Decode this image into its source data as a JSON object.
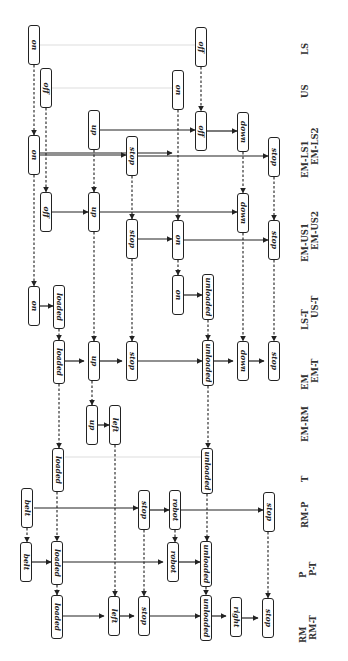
{
  "diagram": {
    "orientation": "rotated 90 degrees",
    "row_labels": [
      {
        "id": "LS",
        "text": "LS",
        "x": 300,
        "y": 55
      },
      {
        "id": "US",
        "text": "US",
        "x": 300,
        "y": 98
      },
      {
        "id": "EM-LS1",
        "text": "EM-LS1",
        "x": 300,
        "y": 178
      },
      {
        "id": "EM-LS2",
        "text": "EM-LS2",
        "x": 310,
        "y": 165
      },
      {
        "id": "EM-US1",
        "text": "EM-US1",
        "x": 300,
        "y": 262
      },
      {
        "id": "EM-US2",
        "text": "EM-US2",
        "x": 310,
        "y": 250
      },
      {
        "id": "LS-T",
        "text": "LS-T",
        "x": 300,
        "y": 330
      },
      {
        "id": "US-T",
        "text": "US-T",
        "x": 310,
        "y": 318
      },
      {
        "id": "EM",
        "text": "EM",
        "x": 300,
        "y": 390
      },
      {
        "id": "EM-T",
        "text": "EM-T",
        "x": 310,
        "y": 383
      },
      {
        "id": "EM-RM",
        "text": "EM-RM",
        "x": 300,
        "y": 442
      },
      {
        "id": "T",
        "text": "T",
        "x": 300,
        "y": 482
      },
      {
        "id": "RM-P",
        "text": "RM-P",
        "x": 300,
        "y": 528
      },
      {
        "id": "P",
        "text": "P",
        "x": 298,
        "y": 578
      },
      {
        "id": "P-T",
        "text": "P-T",
        "x": 308,
        "y": 576
      },
      {
        "id": "RM",
        "text": "RM",
        "x": 298,
        "y": 643
      },
      {
        "id": "RM-T",
        "text": "RM-T",
        "x": 308,
        "y": 640
      }
    ],
    "nodes": [
      {
        "id": "n1",
        "label": "on",
        "x": 28,
        "y": 25,
        "h": 40
      },
      {
        "id": "n2",
        "label": "off",
        "x": 40,
        "y": 68,
        "h": 40
      },
      {
        "id": "n3",
        "label": "on",
        "x": 172,
        "y": 70,
        "h": 40
      },
      {
        "id": "n4",
        "label": "off",
        "x": 195,
        "y": 27,
        "h": 40
      },
      {
        "id": "n5",
        "label": "on",
        "x": 28,
        "y": 135,
        "h": 40
      },
      {
        "id": "n6",
        "label": "up",
        "x": 88,
        "y": 110,
        "h": 40
      },
      {
        "id": "n7",
        "label": "stop",
        "x": 126,
        "y": 136,
        "h": 40
      },
      {
        "id": "n8",
        "label": "off",
        "x": 195,
        "y": 111,
        "h": 40
      },
      {
        "id": "n9",
        "label": "down",
        "x": 237,
        "y": 112,
        "h": 40
      },
      {
        "id": "n10",
        "label": "stop",
        "x": 268,
        "y": 137,
        "h": 40
      },
      {
        "id": "n11",
        "label": "off",
        "x": 40,
        "y": 192,
        "h": 40
      },
      {
        "id": "n12",
        "label": "up",
        "x": 88,
        "y": 192,
        "h": 40
      },
      {
        "id": "n13",
        "label": "stop",
        "x": 126,
        "y": 219,
        "h": 40
      },
      {
        "id": "n14",
        "label": "on",
        "x": 172,
        "y": 220,
        "h": 40
      },
      {
        "id": "n15",
        "label": "down",
        "x": 237,
        "y": 193,
        "h": 40
      },
      {
        "id": "n16",
        "label": "stop",
        "x": 268,
        "y": 220,
        "h": 40
      },
      {
        "id": "n17",
        "label": "on",
        "x": 28,
        "y": 286,
        "h": 40
      },
      {
        "id": "n18",
        "label": "loaded",
        "x": 53,
        "y": 285,
        "h": 44
      },
      {
        "id": "n19",
        "label": "on",
        "x": 172,
        "y": 275,
        "h": 40
      },
      {
        "id": "n20",
        "label": "unloaded",
        "x": 202,
        "y": 274,
        "h": 46
      },
      {
        "id": "n21",
        "label": "loaded",
        "x": 53,
        "y": 340,
        "h": 44
      },
      {
        "id": "n22",
        "label": "up",
        "x": 88,
        "y": 341,
        "h": 40,
        "stacked": true
      },
      {
        "id": "n23",
        "label": "stop",
        "x": 126,
        "y": 341,
        "h": 40,
        "stacked": true
      },
      {
        "id": "n24",
        "label": "unloaded",
        "x": 202,
        "y": 340,
        "h": 46
      },
      {
        "id": "n25",
        "label": "down",
        "x": 237,
        "y": 341,
        "h": 40,
        "stacked": true
      },
      {
        "id": "n26",
        "label": "stop",
        "x": 268,
        "y": 341,
        "h": 40,
        "stacked": true
      },
      {
        "id": "n27",
        "label": "up",
        "x": 86,
        "y": 405,
        "h": 40
      },
      {
        "id": "n28",
        "label": "left",
        "x": 109,
        "y": 405,
        "h": 40
      },
      {
        "id": "n29",
        "label": "loaded",
        "x": 52,
        "y": 448,
        "h": 44
      },
      {
        "id": "n30",
        "label": "unloaded",
        "x": 201,
        "y": 448,
        "h": 46
      },
      {
        "id": "n31",
        "label": "belt",
        "x": 21,
        "y": 488,
        "h": 40
      },
      {
        "id": "n32",
        "label": "stop",
        "x": 138,
        "y": 490,
        "h": 40
      },
      {
        "id": "n33",
        "label": "robot",
        "x": 169,
        "y": 490,
        "h": 40
      },
      {
        "id": "n34",
        "label": "stop",
        "x": 263,
        "y": 492,
        "h": 40
      },
      {
        "id": "n35",
        "label": "belt",
        "x": 20,
        "y": 542,
        "h": 40,
        "stacked": true
      },
      {
        "id": "n36",
        "label": "loaded",
        "x": 51,
        "y": 541,
        "h": 44
      },
      {
        "id": "n37",
        "label": "robot",
        "x": 167,
        "y": 542,
        "h": 40,
        "stacked": true
      },
      {
        "id": "n38",
        "label": "unloaded",
        "x": 200,
        "y": 541,
        "h": 46
      },
      {
        "id": "n39",
        "label": "loaded",
        "x": 51,
        "y": 595,
        "h": 44
      },
      {
        "id": "n40",
        "label": "left",
        "x": 108,
        "y": 596,
        "h": 40,
        "stacked": true
      },
      {
        "id": "n41",
        "label": "stop",
        "x": 138,
        "y": 596,
        "h": 40,
        "stacked": true
      },
      {
        "id": "n42",
        "label": "unloaded",
        "x": 200,
        "y": 595,
        "h": 46
      },
      {
        "id": "n43",
        "label": "right",
        "x": 230,
        "y": 597,
        "h": 40,
        "stacked": true
      },
      {
        "id": "n44",
        "label": "stop",
        "x": 262,
        "y": 598,
        "h": 40,
        "stacked": true
      }
    ],
    "solid_edges": [
      [
        40,
        153,
        172,
        153
      ],
      [
        100,
        130,
        195,
        130
      ],
      [
        40,
        155,
        126,
        155
      ],
      [
        138,
        156,
        268,
        156
      ],
      [
        207,
        131,
        237,
        131
      ],
      [
        52,
        212,
        88,
        212
      ],
      [
        100,
        212,
        237,
        212
      ],
      [
        138,
        239,
        172,
        239
      ],
      [
        184,
        240,
        268,
        240
      ],
      [
        40,
        306,
        53,
        306
      ],
      [
        184,
        295,
        202,
        295
      ],
      [
        65,
        361,
        84,
        361
      ],
      [
        100,
        361,
        122,
        361
      ],
      [
        138,
        361,
        202,
        361
      ],
      [
        214,
        361,
        233,
        361
      ],
      [
        249,
        361,
        264,
        361
      ],
      [
        98,
        425,
        109,
        425
      ],
      [
        34,
        508,
        138,
        508
      ],
      [
        150,
        510,
        169,
        510
      ],
      [
        181,
        510,
        263,
        510
      ],
      [
        32,
        562,
        51,
        562
      ],
      [
        63,
        562,
        163,
        562
      ],
      [
        179,
        562,
        200,
        562
      ],
      [
        63,
        616,
        104,
        616
      ],
      [
        120,
        616,
        134,
        616
      ],
      [
        150,
        616,
        200,
        616
      ],
      [
        212,
        616,
        226,
        616
      ],
      [
        242,
        618,
        258,
        618
      ]
    ],
    "dashed_edges": [
      [
        34,
        65,
        34,
        135
      ],
      [
        46,
        108,
        46,
        192
      ],
      [
        178,
        110,
        178,
        220
      ],
      [
        201,
        67,
        201,
        111
      ],
      [
        94,
        150,
        94,
        192
      ],
      [
        132,
        176,
        132,
        219
      ],
      [
        243,
        152,
        243,
        193
      ],
      [
        274,
        177,
        274,
        220
      ],
      [
        34,
        175,
        34,
        286
      ],
      [
        94,
        232,
        94,
        341
      ],
      [
        132,
        259,
        132,
        341
      ],
      [
        178,
        260,
        178,
        275
      ],
      [
        243,
        233,
        243,
        341
      ],
      [
        274,
        260,
        274,
        341
      ],
      [
        59,
        329,
        59,
        340
      ],
      [
        208,
        320,
        208,
        340
      ],
      [
        59,
        384,
        59,
        448
      ],
      [
        92,
        381,
        92,
        405
      ],
      [
        208,
        386,
        208,
        448
      ],
      [
        27,
        528,
        27,
        542
      ],
      [
        57,
        492,
        57,
        541
      ],
      [
        115,
        445,
        115,
        596
      ],
      [
        144,
        530,
        144,
        596
      ],
      [
        175,
        530,
        175,
        542
      ],
      [
        207,
        494,
        207,
        541
      ],
      [
        268,
        532,
        268,
        598
      ],
      [
        57,
        585,
        57,
        595
      ],
      [
        206,
        587,
        206,
        595
      ]
    ],
    "faint_edges": [
      [
        40,
        45,
        195,
        45
      ],
      [
        52,
        88,
        172,
        88
      ],
      [
        65,
        457,
        201,
        457
      ]
    ]
  }
}
